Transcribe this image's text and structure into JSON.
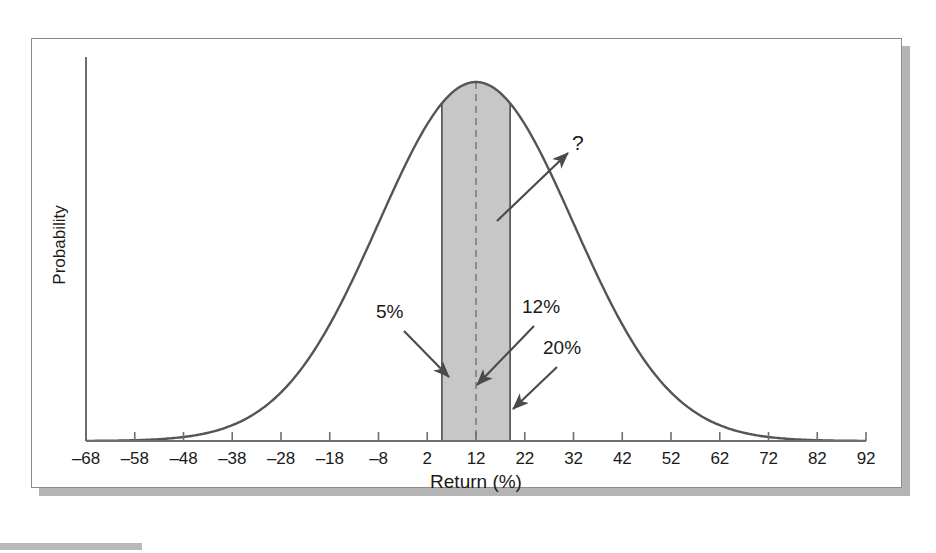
{
  "figure": {
    "y_axis_title": "Probability",
    "x_axis_title": "Return (%)"
  },
  "annotations": {
    "lower": "5%",
    "center": "12%",
    "upper": "20%",
    "unknown": "?"
  },
  "colors": {
    "curve": "#555555",
    "band_fill": "#c7c7c7",
    "band_edge": "#4d4d4d",
    "axis": "#6e6e6e",
    "text": "#1a1a1a",
    "frame": "#8c8c8c",
    "shadow": "#b4b4b4"
  },
  "chart_data": {
    "type": "line",
    "title": "",
    "subtitle": "",
    "xlabel": "Return (%)",
    "ylabel": "Probability",
    "xlim": [
      -68,
      92
    ],
    "ylim": [
      0,
      1
    ],
    "grid": false,
    "legend": null,
    "x_ticks": [
      -68,
      -58,
      -48,
      -38,
      -28,
      -18,
      -8,
      2,
      12,
      22,
      32,
      42,
      52,
      62,
      72,
      82,
      92
    ],
    "x_tick_labels": [
      "–68",
      "–58",
      "–48",
      "–38",
      "–28",
      "–18",
      "–8",
      "2",
      "12",
      "22",
      "32",
      "42",
      "52",
      "62",
      "72",
      "82",
      "92"
    ],
    "y_ticks": [],
    "y_tick_labels": [],
    "distribution": {
      "kind": "normal",
      "mean": 12,
      "std_dev": 20,
      "mean_label": "12%",
      "std_dev_label": "20%"
    },
    "shaded_band": {
      "from": 5,
      "to": 19,
      "from_label": "5%",
      "to_label": "20%",
      "fill": "#c7c7c7"
    },
    "center_line": {
      "x": 12,
      "style": "dashed",
      "label": "12%"
    },
    "callouts": [
      {
        "label": "5%",
        "points_to_x": 5,
        "points_to_y": 0.14
      },
      {
        "label": "12%",
        "points_to_x": 12,
        "points_to_y": 0.1
      },
      {
        "label": "20%",
        "points_to_x": 19,
        "points_to_y": 0.03
      },
      {
        "label": "?",
        "points_to_x": 32,
        "points_to_y": 0.72
      }
    ],
    "series": [
      {
        "name": "probability density",
        "x": [
          -68,
          -63,
          -58,
          -53,
          -48,
          -43,
          -38,
          -33,
          -28,
          -23,
          -18,
          -13,
          -8,
          -3,
          2,
          7,
          12,
          17,
          22,
          27,
          32,
          37,
          42,
          47,
          52,
          57,
          62,
          67,
          72,
          77,
          82,
          87,
          92
        ],
        "values": [
          0.0,
          0.001,
          0.002,
          0.005,
          0.011,
          0.022,
          0.04,
          0.068,
          0.106,
          0.156,
          0.217,
          0.287,
          0.362,
          0.435,
          0.5,
          0.55,
          0.581,
          0.589,
          0.574,
          0.537,
          0.484,
          0.42,
          0.352,
          0.284,
          0.221,
          0.166,
          0.12,
          0.084,
          0.056,
          0.036,
          0.023,
          0.013,
          0.008
        ]
      }
    ]
  }
}
